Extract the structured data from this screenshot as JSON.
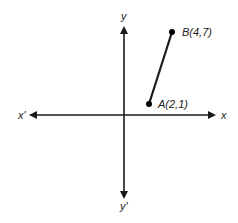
{
  "diagram": {
    "axes": {
      "x_pos_label": "x",
      "x_neg_label": "x'",
      "y_pos_label": "y",
      "y_neg_label": "y'"
    },
    "points": [
      {
        "name": "A",
        "label": "A(2,1)",
        "x": 2,
        "y": 1
      },
      {
        "name": "B",
        "label": "B(4,7)",
        "x": 4,
        "y": 7
      }
    ],
    "segment": {
      "from": "A",
      "to": "B"
    },
    "colors": {
      "ink": "#1a1a1a",
      "background": "#ffffff"
    }
  }
}
